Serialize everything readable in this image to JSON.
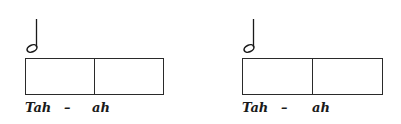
{
  "exercise": {
    "note_icon": "half-note-icon",
    "groups": [
      {
        "syllable_1": "Tah",
        "dash": "–",
        "syllable_2": "ah"
      },
      {
        "syllable_1": "Tah",
        "dash": "–",
        "syllable_2": "ah"
      }
    ]
  }
}
